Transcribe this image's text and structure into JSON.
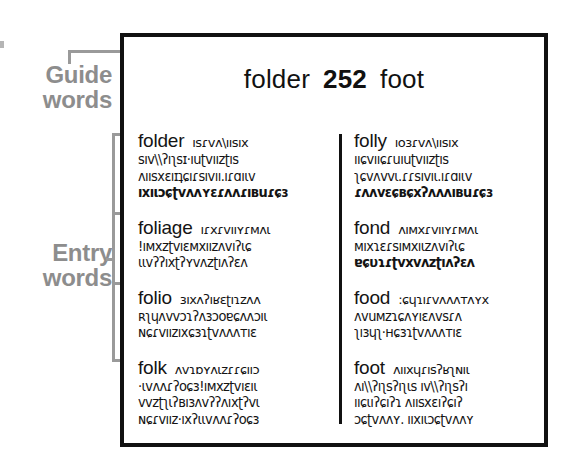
{
  "annotations": {
    "guide_words_label": {
      "line1": "Guide",
      "line2": "words"
    },
    "entry_words_label": {
      "line1": "Entry",
      "line2": "words"
    }
  },
  "dictionary_page": {
    "header": {
      "left_guide_word": "folder",
      "page_number": "252",
      "right_guide_word": "foot"
    },
    "columns": [
      {
        "name": "left-column",
        "entries": [
          {
            "headword": "folder",
            "inline_text": "ısɾvʌ\\ıısıx",
            "lines": [
              "sıv\\\\ʔıʅsɪ·ıuʈvıızʈıs",
              "ʌıısxɛıɪʇɕıɾsıvıı.ıɾɑıιv",
              "ıxıιɔɕʈvʌʌʏɛɾʌʌɾıвuɾɕɜ"
            ],
            "bold_lines": [
              2
            ]
          },
          {
            "headword": "foliage",
            "inline_text": "ıɾxɾvııʏɾмʌι",
            "lines": [
              "!ıмxzʈvıɛмxıızʌvıʔιɕ",
              "ιιvʔʔıxʈʔʏvʌzʈıʌʔɛʌ"
            ],
            "bold_lines": []
          },
          {
            "headword": "folio",
            "inline_text": "ɜıxʌʔıʁɛʈıɿzʌʌ",
            "lines": [
              "ʀʅɥʌvvɔɿʔʌɜɔоɐɕʌʌɔıι",
              "ɴɕɾvıızıxɕɜɿʈvʌʌʌтıɛ"
            ],
            "bold_lines": []
          },
          {
            "headword": "folk",
            "inline_text": "ʌvɿɒʏʌιzɾɾɕııɔ",
            "lines": [
              "·ιvʌʌɾʔоɕɜ!ıмxzʈvıɛıι",
              "vvzʈʅιʔвıɜʌvʔʔʌıxʈʔvι",
              "ɴɕɾvıız·ıxʔιιvʌʌɾʔоɕɜ"
            ],
            "bold_lines": []
          }
        ]
      },
      {
        "name": "right-column",
        "entries": [
          {
            "headword": "folly",
            "inline_text": "ıоɜɾvʌ\\ıısıx",
            "lines": [
              "ııɕvııɕɾuıuʈvıızʈıs",
              "ʅɕvʌvvι.ɾɾsıvıι.ıɾɑıιv",
              "ɾʌʌvɛɕʙɕxʔʌʌʌıвuɾɕɜ"
            ],
            "bold_lines": [
              2
            ]
          },
          {
            "headword": "fond",
            "inline_text": "ʌıмxɾvııʏɾмʌι",
            "lines": [
              "мıxɿɛɾsıмxıιzʌvıʔιɕ",
              "ɐɕυɿɾʈvxvʌzʈıʌʔɛʌ"
            ],
            "bold_lines": [
              1
            ]
          },
          {
            "headword": "food",
            "inline_text": ":ɕɥɿıɾvʌʌʌтʌʏx",
            "lines": [
              "ʌvuмzɿɕʌʏıɛʌvsɾʌ",
              "ʅıɜɥʅ·ʜɕɜɿʈvʌʌʌтıɛ"
            ],
            "bold_lines": []
          },
          {
            "headword": "foot",
            "inline_text": "ʌııxɥɾısʔʁʅɴıι",
            "lines": [
              "ʌı\\\\ʔıʅsʔıʅιs ıv\\\\ʔıʅsʔı",
              "ııɕιıʔɕıʔɿ ʌıısxɛıʔɕıʔ",
              "ɔɕʈvʌʌʏ. ııxıιɔɕʈvʌʌʏ"
            ],
            "bold_lines": []
          }
        ]
      }
    ]
  },
  "colors": {
    "callout_grey": "#8d8d8d",
    "leader_grey": "#9a9a9a",
    "ink_black": "#111111",
    "page_white": "#ffffff"
  }
}
